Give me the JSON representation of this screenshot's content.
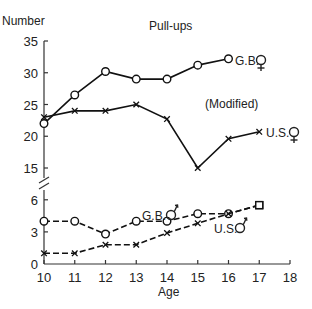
{
  "chart_data": {
    "type": "line",
    "title": "Pull-ups",
    "subtitle": "(Modified)",
    "xlabel": "Age",
    "ylabel": "Number",
    "x": [
      10,
      11,
      12,
      13,
      14,
      15,
      16,
      17
    ],
    "xticks": [
      10,
      11,
      12,
      13,
      14,
      15,
      16,
      17,
      18
    ],
    "xlim": [
      10,
      18
    ],
    "y_axis_broken": true,
    "upper_yticks": [
      15,
      20,
      25,
      30,
      35
    ],
    "lower_yticks": [
      0,
      3,
      6
    ],
    "grid": false,
    "series": [
      {
        "name": "G.B. ♀",
        "panel": "upper",
        "marker": "circle",
        "line": "solid",
        "x": [
          10,
          11,
          12,
          13,
          14,
          15,
          16
        ],
        "values": [
          22,
          26.5,
          30.2,
          29,
          29,
          31.2,
          32.2
        ]
      },
      {
        "name": "U.S. ♀",
        "panel": "upper",
        "marker": "x",
        "line": "solid",
        "x": [
          10,
          11,
          12,
          13,
          14,
          15,
          16,
          17
        ],
        "values": [
          23,
          24,
          24,
          25,
          22.7,
          15,
          19.6,
          20.7
        ]
      },
      {
        "name": "G.B. ♂",
        "panel": "lower",
        "marker": "circle",
        "line": "dashed",
        "x": [
          10,
          11,
          12,
          13,
          14,
          15,
          16,
          17
        ],
        "values": [
          4,
          4,
          2.8,
          4,
          4,
          4.7,
          4.7,
          5.5
        ]
      },
      {
        "name": "U.S. ♂",
        "panel": "lower",
        "marker": "x",
        "line": "dashed",
        "x": [
          10,
          11,
          12,
          13,
          14,
          15,
          16,
          17
        ],
        "values": [
          1,
          1,
          1.8,
          1.8,
          2.9,
          3.8,
          4.7,
          5.5
        ]
      }
    ],
    "annotations": [
      {
        "text": "G.B. ♀",
        "near": "upper G.B. series end"
      },
      {
        "text": "U.S. ♀",
        "near": "upper U.S. series end"
      },
      {
        "text": "G.B. ♂",
        "near": "lower G.B. series at age 14"
      },
      {
        "text": "U.S. ♂",
        "near": "lower U.S. series at age 16"
      }
    ]
  },
  "labels": {
    "title": "Pull-ups",
    "subtitle": "(Modified)",
    "ylabel": "Number",
    "xlabel": "Age",
    "gb_girls": "G.B.",
    "us_girls": "U.S.",
    "gb_boys": "G.B.",
    "us_boys": "U.S."
  }
}
